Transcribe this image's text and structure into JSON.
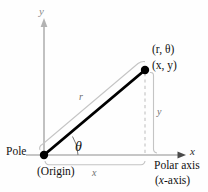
{
  "figure": {
    "background_color": "#fefefe",
    "axis_color": "#b2b2b2",
    "ray_color": "#000000",
    "guide_color": "#bdbdbd",
    "dash_color": "#c0c0c0",
    "labels": {
      "y_axis": "y",
      "x_axis": "x",
      "pole": "Pole",
      "origin": "(Origin)",
      "polar_axis": "Polar axis",
      "x_axis_paren": "(x-axis)",
      "polar_point": "(r, θ)",
      "rect_point": "(x, y)",
      "radius": "r",
      "angle": "θ",
      "leg_x": "x",
      "leg_y": "y"
    },
    "geometry": {
      "origin_x": 44,
      "origin_y": 155,
      "point_x": 145,
      "point_y": 70,
      "x_axis_end": 185,
      "y_axis_top": 20
    }
  }
}
